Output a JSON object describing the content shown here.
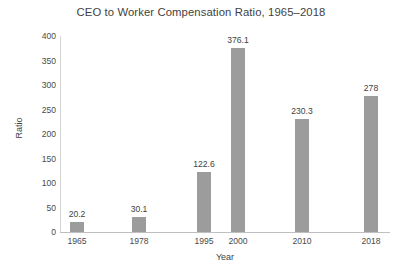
{
  "chart_data": {
    "type": "bar",
    "title": "CEO to Worker Compensation Ratio, 1965–2018",
    "xlabel": "Year",
    "ylabel": "Ratio",
    "categories": [
      "1965",
      "1978",
      "1995",
      "2000",
      "2010",
      "2018"
    ],
    "values": [
      20.2,
      30.1,
      122.6,
      376.1,
      230.3,
      278
    ],
    "value_labels": [
      "20.2",
      "30.1",
      "122.6",
      "376.1",
      "230.3",
      "278"
    ],
    "ylim": [
      0,
      400
    ],
    "yticks": [
      0,
      50,
      100,
      150,
      200,
      250,
      300,
      350,
      400
    ],
    "ytick_labels": [
      "0",
      "50",
      "100",
      "150",
      "200",
      "250",
      "300",
      "350",
      "400"
    ],
    "grid": false,
    "legend": false,
    "series": [
      {
        "name": "Ratio",
        "values": [
          20.2,
          30.1,
          122.6,
          376.1,
          230.3,
          278
        ]
      }
    ],
    "colors": {
      "bar": "#9c9c9c",
      "axis": "#bfbfbf",
      "text": "#3f3f3f",
      "background": "#ffffff"
    }
  }
}
